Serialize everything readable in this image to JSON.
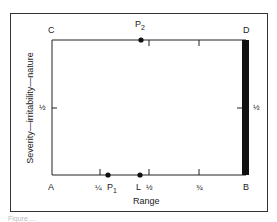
{
  "figure": {
    "corners": {
      "A": "A",
      "B": "B",
      "C": "C",
      "D": "D"
    },
    "points": {
      "P1": "P",
      "P1_sub": "1",
      "P2": "P",
      "P2_sub": "2",
      "L": "L"
    },
    "x_axis": {
      "label": "Range",
      "ticks": [
        "¼",
        "½",
        "¾"
      ]
    },
    "y_axis": {
      "label": "Severity—irritability—nature",
      "ticks_left": [
        "½"
      ],
      "ticks_right": [
        "½"
      ]
    },
    "caption": "Figure ..."
  },
  "colors": {
    "line": "#222222",
    "thick_bar": "#111111"
  }
}
